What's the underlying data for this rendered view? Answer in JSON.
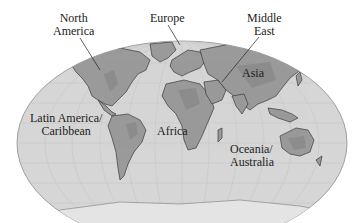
{
  "map": {
    "projection": "mollweide-style world map (grayscale relief)",
    "colors": {
      "ocean": "#d4d4d4",
      "land": "#9a9a9a",
      "land_dark": "#7d7d7d",
      "grid": "#bcbcbc",
      "outline": "#3a3a3a",
      "background": "#ffffff"
    }
  },
  "labels": {
    "north_america": [
      "North",
      "America"
    ],
    "europe": "Europe",
    "middle_east": [
      "Middle",
      "East"
    ],
    "asia": "Asia",
    "latin_america": [
      "Latin America/",
      "Caribbean"
    ],
    "africa": "Africa",
    "oceania": [
      "Oceania/",
      "Australia"
    ]
  }
}
